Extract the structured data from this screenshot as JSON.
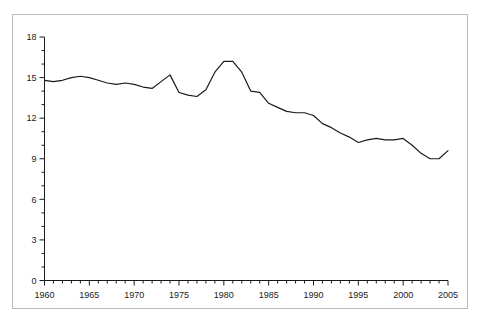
{
  "chart_data": {
    "type": "line",
    "title": "",
    "subtitle": "",
    "xlabel": "",
    "ylabel": "",
    "xlim": [
      1960,
      2005
    ],
    "ylim": [
      0,
      18
    ],
    "grid": false,
    "legend": null,
    "y_ticks": [
      0,
      3,
      6,
      9,
      12,
      15,
      18
    ],
    "y_tick_labels": [
      "0",
      "3",
      "6",
      "9",
      "12",
      "15",
      "18"
    ],
    "y_minor_tick_step": 1,
    "x_tick_labels": [
      "1960",
      "1965",
      "1970",
      "1975",
      "1980",
      "1985",
      "1990",
      "1995",
      "2000",
      "2005"
    ],
    "x_minor_tick_step": 1,
    "series": [
      {
        "name": "series-1",
        "color": "#1a1a1a",
        "x": [
          1960,
          1961,
          1962,
          1963,
          1964,
          1965,
          1966,
          1967,
          1968,
          1969,
          1970,
          1971,
          1972,
          1973,
          1974,
          1975,
          1976,
          1977,
          1978,
          1979,
          1980,
          1981,
          1982,
          1983,
          1984,
          1985,
          1986,
          1987,
          1988,
          1989,
          1990,
          1991,
          1992,
          1993,
          1994,
          1995,
          1996,
          1997,
          1998,
          1999,
          2000,
          2001,
          2002,
          2003,
          2004,
          2005
        ],
        "values": [
          14.8,
          14.7,
          14.8,
          15.0,
          15.1,
          15.0,
          14.8,
          14.6,
          14.5,
          14.6,
          14.5,
          14.3,
          14.2,
          14.7,
          15.2,
          13.9,
          13.7,
          13.6,
          14.1,
          15.4,
          16.2,
          16.2,
          15.4,
          14.0,
          13.9,
          13.1,
          12.8,
          12.5,
          12.4,
          12.4,
          12.2,
          11.6,
          11.3,
          10.9,
          10.6,
          10.2,
          10.4,
          10.5,
          10.4,
          10.4,
          10.5,
          10.0,
          9.4,
          9.0,
          9.0,
          9.6
        ]
      }
    ]
  },
  "axes": {
    "y_axis_name": "y-axis",
    "x_axis_name": "x-axis"
  }
}
